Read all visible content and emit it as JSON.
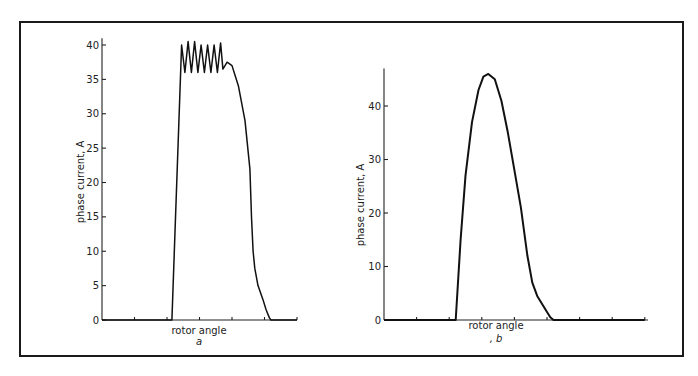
{
  "figure": {
    "caption_fragment": "",
    "panels": [
      {
        "id": "a",
        "sublabel": "a",
        "xlabel": "rotor angle",
        "ylabel": "phase current, A"
      },
      {
        "id": "b",
        "sublabel": ", b",
        "xlabel": "rotor angle",
        "ylabel": "phase current, A"
      }
    ]
  },
  "chart_data": [
    {
      "type": "line",
      "title": "",
      "panel_label": "a",
      "xlabel": "rotor angle",
      "ylabel": "phase current, A",
      "yticks": [
        0,
        5,
        10,
        15,
        20,
        25,
        30,
        35,
        40
      ],
      "ylim": [
        0,
        41
      ],
      "x_tick_count": 6,
      "x_tick_labels": [],
      "grid": false,
      "legend": null,
      "x_units": "tick divisions (unlabeled)",
      "x": [
        0,
        2.15,
        2.45,
        2.55,
        2.65,
        2.75,
        2.85,
        2.95,
        3.05,
        3.15,
        3.25,
        3.35,
        3.45,
        3.55,
        3.65,
        3.72,
        3.85,
        4.0,
        4.2,
        4.4,
        4.55,
        4.6,
        4.65,
        4.7,
        4.8,
        4.95,
        5.05,
        5.15,
        5.2,
        6.0
      ],
      "y": [
        0,
        0,
        40,
        36,
        40.5,
        36,
        40.5,
        36,
        40,
        36,
        40,
        36,
        40,
        36,
        40.3,
        36.5,
        37.5,
        37,
        34,
        29,
        22,
        15,
        10,
        7.5,
        5,
        3,
        1.5,
        0.3,
        0,
        0
      ],
      "annotations": [
        "chopped current ripple between ~36 A and ~40.5 A"
      ]
    },
    {
      "type": "line",
      "title": "",
      "panel_label": "b",
      "xlabel": "rotor angle",
      "ylabel": "phase current, A",
      "yticks": [
        0,
        10,
        20,
        30,
        40
      ],
      "ylim": [
        0,
        47
      ],
      "x_tick_count": 8,
      "x_tick_labels": [],
      "grid": false,
      "legend": null,
      "x_units": "tick divisions (unlabeled)",
      "x": [
        0,
        2.2,
        2.35,
        2.5,
        2.7,
        2.9,
        3.05,
        3.2,
        3.4,
        3.6,
        3.8,
        4.0,
        4.2,
        4.4,
        4.55,
        4.7,
        4.85,
        5.0,
        5.1,
        5.2,
        8.0
      ],
      "y": [
        0,
        0,
        15,
        27,
        37,
        43,
        45.5,
        46,
        45,
        41,
        35,
        28,
        21,
        12,
        7,
        4.5,
        3,
        1.5,
        0.5,
        0,
        0
      ],
      "annotations": []
    }
  ]
}
